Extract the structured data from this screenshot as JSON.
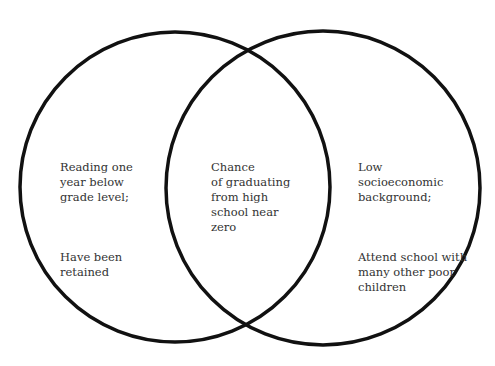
{
  "diagram": {
    "type": "venn",
    "stroke_color": "#111111",
    "left_circle": {
      "lines_1": "Reading one\nyear below\ngrade level;",
      "lines_2": "Have been\nretained"
    },
    "intersection": {
      "text": "Chance\nof graduating\nfrom high\nschool near\nzero"
    },
    "right_circle": {
      "lines_1": "Low\nsocioeconomic\nbackground;",
      "lines_2": "Attend school with\nmany other poor\nchildren"
    }
  }
}
